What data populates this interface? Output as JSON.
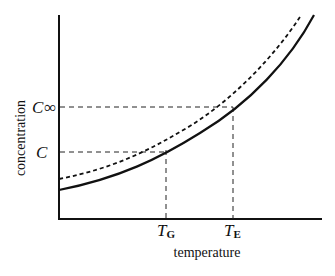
{
  "diagram": {
    "ylabel": "concentration",
    "xlabel": "temperature",
    "y_marks": [
      {
        "main": "C",
        "sub": "∞"
      },
      {
        "main": "C",
        "sub": ""
      }
    ],
    "x_marks": [
      {
        "main": "T",
        "sub": "G"
      },
      {
        "main": "T",
        "sub": "E"
      }
    ],
    "curves": [
      {
        "name": "equilibrium-curve",
        "style": "solid"
      },
      {
        "name": "upper-curve",
        "style": "dashed"
      }
    ]
  }
}
